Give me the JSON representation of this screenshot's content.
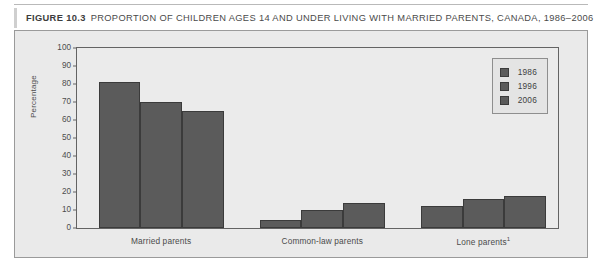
{
  "figure": {
    "number_label": "FIGURE 10.3",
    "title": "PROPORTION OF CHILDREN AGES 14 AND UNDER LIVING WITH MARRIED PARENTS, CANADA, 1986–2006"
  },
  "legend": {
    "position": "top-right",
    "entries": [
      {
        "label": "1986",
        "color": "#5b5b5b"
      },
      {
        "label": "1996",
        "color": "#5b5b5b"
      },
      {
        "label": "2006",
        "color": "#5b5b5b"
      }
    ]
  },
  "axes": {
    "ylabel": "Percentage",
    "yticks": [
      "100",
      "90",
      "80",
      "70",
      "60",
      "50",
      "40",
      "30",
      "20",
      "10",
      "0"
    ],
    "xlabels": [
      {
        "text": "Married parents",
        "footnote": ""
      },
      {
        "text": "Common-law parents",
        "footnote": ""
      },
      {
        "text": "Lone parents",
        "footnote": "1"
      }
    ]
  },
  "chart_data": {
    "type": "bar",
    "title": "PROPORTION OF CHILDREN AGES 14 AND UNDER LIVING WITH MARRIED PARENTS, CANADA, 1986–2006",
    "xlabel": "",
    "ylabel": "Percentage",
    "ylim": [
      0,
      100
    ],
    "ytick_step": 10,
    "grid": false,
    "legend_position": "top-right",
    "categories": [
      "Married parents",
      "Common-law parents",
      "Lone parents"
    ],
    "series": [
      {
        "name": "1986",
        "values": [
          81,
          4.5,
          12
        ]
      },
      {
        "name": "1996",
        "values": [
          70,
          10,
          16
        ]
      },
      {
        "name": "2006",
        "values": [
          65,
          14,
          18
        ]
      }
    ],
    "bar_color": "#5b5b5b",
    "plot_background": "#ebebeb"
  }
}
